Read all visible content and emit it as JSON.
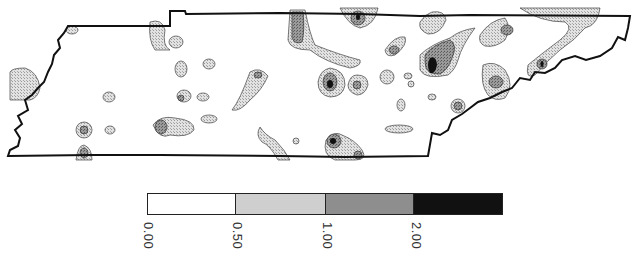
{
  "map": {
    "region": "Tennessee",
    "type": "contour-map",
    "colors": {
      "outline": "#111111",
      "class0": "#ffffff",
      "class1": "#cfcfcf",
      "class2": "#8e8e8e",
      "class3": "#111111"
    }
  },
  "legend": {
    "classes": [
      {
        "label": "0.00",
        "range": "0.00–0.50",
        "color": "#ffffff"
      },
      {
        "label": "0.50",
        "range": "0.50–1.00",
        "color": "#cfcfcf"
      },
      {
        "label": "1.00",
        "range": "1.00–2.00",
        "color": "#8e8e8e"
      },
      {
        "label": "2.00",
        "range": "≥2.00",
        "color": "#111111"
      }
    ]
  },
  "caption": {
    "text": ""
  }
}
